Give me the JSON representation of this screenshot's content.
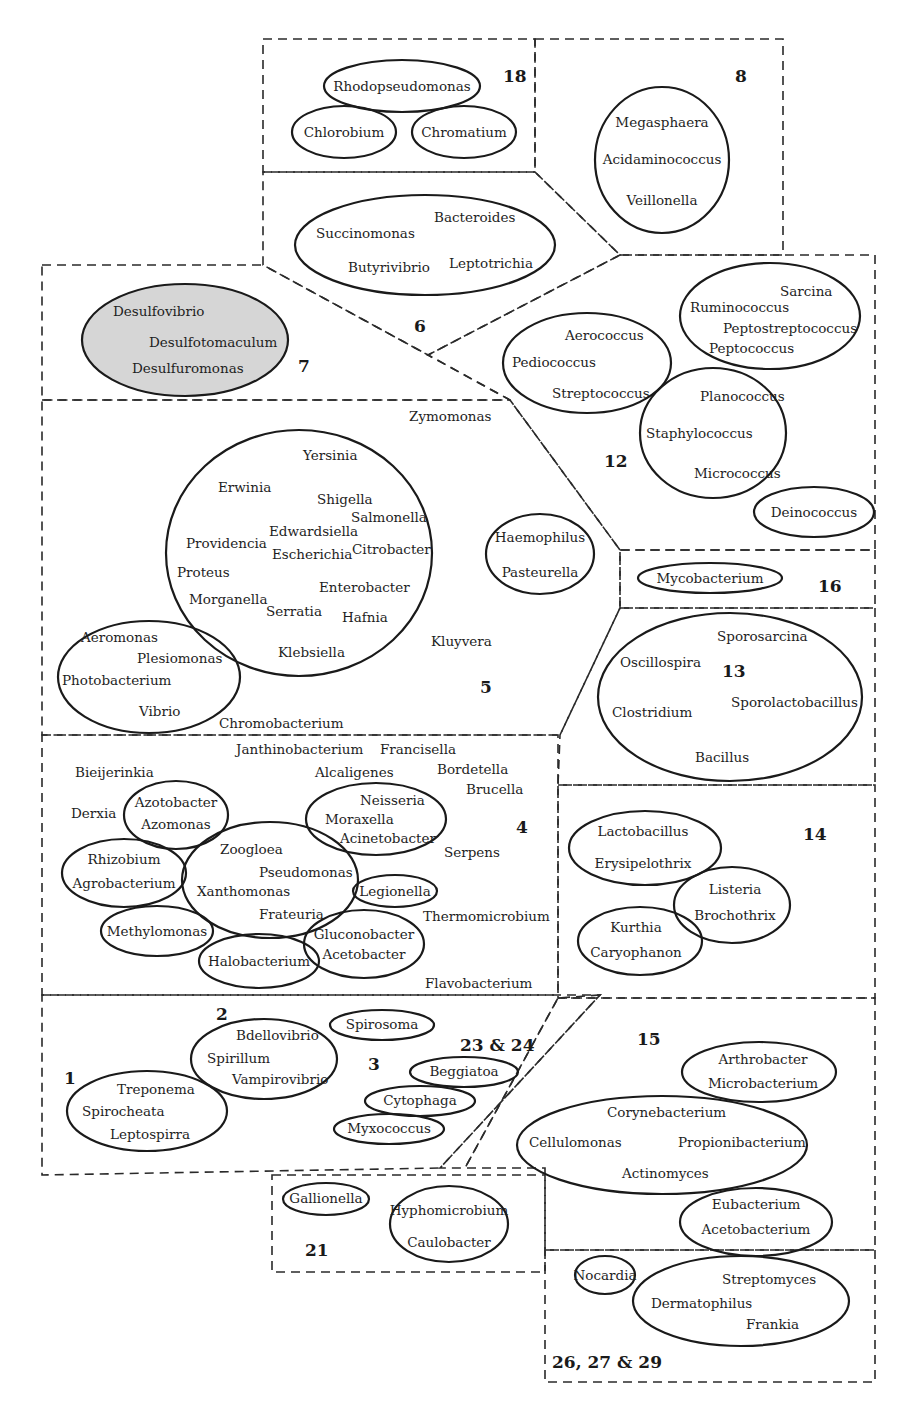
{
  "colors": {
    "line": "#1a1a1a",
    "shaded_fill": "#d6d6d6",
    "background": "#ffffff"
  },
  "boundaries": [
    {
      "name": "group-18-boundary",
      "points": "263,39 535,39 535,172 263,172"
    },
    {
      "name": "group-8-boundary",
      "points": "535,39 783,39 783,255 620,255 535,172"
    },
    {
      "name": "group-6-boundary",
      "points": "263,172 535,172 620,255 428,355 263,265"
    },
    {
      "name": "group-7-boundary",
      "points": "42,265 263,265 428,355 510,400 42,400"
    },
    {
      "name": "group-12-boundary",
      "points": "620,255 875,255 875,550 620,550 510,400 428,355"
    },
    {
      "name": "group-5-boundary",
      "points": "42,400 510,400 620,550 620,608 560,735 42,735"
    },
    {
      "name": "group-16-boundary",
      "points": "620,550 875,550 875,608 620,608"
    },
    {
      "name": "group-13-boundary",
      "points": "620,608 875,608 875,785 558,785 560,735"
    },
    {
      "name": "group-4-boundary",
      "points": "42,735 558,735 558,995 42,995"
    },
    {
      "name": "group-14-boundary",
      "points": "558,785 875,785 875,998 558,998"
    },
    {
      "name": "group-1-3-boundary",
      "points": "42,995 600,995 440,1168 42,1175"
    },
    {
      "name": "group-23-24-boundary",
      "points": "600,995 558,998 465,1168 440,1168"
    },
    {
      "name": "group-15-boundary",
      "points": "558,998 875,998 875,1250 545,1250 545,1168 465,1168"
    },
    {
      "name": "group-21-boundary",
      "points": "272,1175 545,1175 545,1272 272,1272"
    },
    {
      "name": "group-26-27-29-boundary",
      "points": "545,1250 875,1250 875,1382 545,1382"
    }
  ],
  "ellipses": [
    {
      "name": "ellipse-rhodopseudomonas",
      "cx": 402,
      "cy": 86,
      "rx": 78,
      "ry": 26
    },
    {
      "name": "ellipse-chlorobium",
      "cx": 344,
      "cy": 132,
      "rx": 52,
      "ry": 26
    },
    {
      "name": "ellipse-chromatium",
      "cx": 464,
      "cy": 132,
      "rx": 52,
      "ry": 26
    },
    {
      "name": "ellipse-group-8",
      "cx": 662,
      "cy": 160,
      "rx": 67,
      "ry": 73
    },
    {
      "name": "ellipse-group-6",
      "cx": 425,
      "cy": 245,
      "rx": 130,
      "ry": 50
    },
    {
      "name": "ellipse-group-7",
      "cx": 185,
      "cy": 340,
      "rx": 103,
      "ry": 56,
      "shaded": true
    },
    {
      "name": "ellipse-streptococcus",
      "cx": 587,
      "cy": 363,
      "rx": 84,
      "ry": 50
    },
    {
      "name": "ellipse-ruminococcus",
      "cx": 770,
      "cy": 316,
      "rx": 90,
      "ry": 53
    },
    {
      "name": "ellipse-staphylococcus",
      "cx": 713,
      "cy": 433,
      "rx": 73,
      "ry": 65
    },
    {
      "name": "ellipse-deinococcus",
      "cx": 814,
      "cy": 512,
      "rx": 60,
      "ry": 25
    },
    {
      "name": "ellipse-enterobacteria",
      "cx": 299,
      "cy": 553,
      "rx": 133,
      "ry": 123
    },
    {
      "name": "ellipse-haemophilus",
      "cx": 540,
      "cy": 554,
      "rx": 54,
      "ry": 40
    },
    {
      "name": "ellipse-vibrio",
      "cx": 149,
      "cy": 677,
      "rx": 91,
      "ry": 56
    },
    {
      "name": "ellipse-mycobacterium",
      "cx": 710,
      "cy": 578,
      "rx": 72,
      "ry": 15
    },
    {
      "name": "ellipse-group-13",
      "cx": 730,
      "cy": 697,
      "rx": 132,
      "ry": 84
    },
    {
      "name": "ellipse-azotobacter",
      "cx": 176,
      "cy": 815,
      "rx": 52,
      "ry": 34
    },
    {
      "name": "ellipse-rhizobium",
      "cx": 124,
      "cy": 873,
      "rx": 62,
      "ry": 34
    },
    {
      "name": "ellipse-pseudomonas",
      "cx": 270,
      "cy": 880,
      "rx": 88,
      "ry": 58
    },
    {
      "name": "ellipse-neisseria",
      "cx": 376,
      "cy": 819,
      "rx": 70,
      "ry": 36
    },
    {
      "name": "ellipse-legionella",
      "cx": 395,
      "cy": 891,
      "rx": 42,
      "ry": 16
    },
    {
      "name": "ellipse-methylomonas",
      "cx": 157,
      "cy": 931,
      "rx": 56,
      "ry": 25
    },
    {
      "name": "ellipse-halobacterium",
      "cx": 259,
      "cy": 961,
      "rx": 60,
      "ry": 27
    },
    {
      "name": "ellipse-gluconobacter",
      "cx": 364,
      "cy": 944,
      "rx": 60,
      "ry": 34
    },
    {
      "name": "ellipse-lactobacillus",
      "cx": 645,
      "cy": 848,
      "rx": 76,
      "ry": 37
    },
    {
      "name": "ellipse-listeria",
      "cx": 732,
      "cy": 905,
      "rx": 58,
      "ry": 38
    },
    {
      "name": "ellipse-kurthia",
      "cx": 640,
      "cy": 941,
      "rx": 62,
      "ry": 34
    },
    {
      "name": "ellipse-spirosoma",
      "cx": 382,
      "cy": 1025,
      "rx": 52,
      "ry": 15
    },
    {
      "name": "ellipse-spirillum",
      "cx": 264,
      "cy": 1059,
      "rx": 73,
      "ry": 40
    },
    {
      "name": "ellipse-treponema",
      "cx": 147,
      "cy": 1111,
      "rx": 80,
      "ry": 40
    },
    {
      "name": "ellipse-beggiatoa",
      "cx": 464,
      "cy": 1072,
      "rx": 54,
      "ry": 15
    },
    {
      "name": "ellipse-cytophaga",
      "cx": 420,
      "cy": 1101,
      "rx": 55,
      "ry": 15
    },
    {
      "name": "ellipse-myxococcus",
      "cx": 389,
      "cy": 1129,
      "rx": 55,
      "ry": 15
    },
    {
      "name": "ellipse-arthrobacter",
      "cx": 759,
      "cy": 1072,
      "rx": 77,
      "ry": 30
    },
    {
      "name": "ellipse-corynebacterium",
      "cx": 662,
      "cy": 1145,
      "rx": 145,
      "ry": 49
    },
    {
      "name": "ellipse-eubacterium",
      "cx": 756,
      "cy": 1222,
      "rx": 76,
      "ry": 34
    },
    {
      "name": "ellipse-gallionella",
      "cx": 326,
      "cy": 1199,
      "rx": 43,
      "ry": 16
    },
    {
      "name": "ellipse-hyphomicrobium",
      "cx": 449,
      "cy": 1224,
      "rx": 59,
      "ry": 38
    },
    {
      "name": "ellipse-nocardia",
      "cx": 605,
      "cy": 1275,
      "rx": 30,
      "ry": 19
    },
    {
      "name": "ellipse-streptomyces",
      "cx": 741,
      "cy": 1301,
      "rx": 108,
      "ry": 45
    }
  ],
  "group_labels": [
    {
      "text": "18",
      "x": 503,
      "y": 82
    },
    {
      "text": "8",
      "x": 735,
      "y": 82
    },
    {
      "text": "6",
      "x": 414,
      "y": 332
    },
    {
      "text": "7",
      "x": 298,
      "y": 372
    },
    {
      "text": "12",
      "x": 604,
      "y": 467
    },
    {
      "text": "5",
      "x": 480,
      "y": 693
    },
    {
      "text": "16",
      "x": 818,
      "y": 592
    },
    {
      "text": "13",
      "x": 722,
      "y": 677
    },
    {
      "text": "4",
      "x": 516,
      "y": 833
    },
    {
      "text": "14",
      "x": 803,
      "y": 840
    },
    {
      "text": "2",
      "x": 216,
      "y": 1020
    },
    {
      "text": "1",
      "x": 64,
      "y": 1084
    },
    {
      "text": "3",
      "x": 368,
      "y": 1070
    },
    {
      "text": "23 & 24",
      "x": 460,
      "y": 1051
    },
    {
      "text": "15",
      "x": 637,
      "y": 1045
    },
    {
      "text": "21",
      "x": 305,
      "y": 1256
    },
    {
      "text": "26, 27 & 29",
      "x": 552,
      "y": 1368
    }
  ],
  "genera": [
    {
      "text": "Rhodopseudomonas",
      "x": 402,
      "y": 91,
      "anchor": "middle"
    },
    {
      "text": "Chlorobium",
      "x": 344,
      "y": 137,
      "anchor": "middle"
    },
    {
      "text": "Chromatium",
      "x": 464,
      "y": 137,
      "anchor": "middle"
    },
    {
      "text": "Megasphaera",
      "x": 662,
      "y": 127,
      "anchor": "middle"
    },
    {
      "text": "Acidaminococcus",
      "x": 662,
      "y": 164,
      "anchor": "middle"
    },
    {
      "text": "Veillonella",
      "x": 662,
      "y": 205,
      "anchor": "middle"
    },
    {
      "text": "Succinomonas",
      "x": 316,
      "y": 238,
      "anchor": "start"
    },
    {
      "text": "Bacteroides",
      "x": 434,
      "y": 222,
      "anchor": "start"
    },
    {
      "text": "Butyrivibrio",
      "x": 348,
      "y": 272,
      "anchor": "start"
    },
    {
      "text": "Leptotrichia",
      "x": 449,
      "y": 268,
      "anchor": "start"
    },
    {
      "text": "Desulfovibrio",
      "x": 113,
      "y": 316,
      "anchor": "start"
    },
    {
      "text": "Desulfotomaculum",
      "x": 149,
      "y": 347,
      "anchor": "start"
    },
    {
      "text": "Desulfuromonas",
      "x": 132,
      "y": 373,
      "anchor": "start"
    },
    {
      "text": "Aerococcus",
      "x": 565,
      "y": 340,
      "anchor": "start"
    },
    {
      "text": "Pediococcus",
      "x": 512,
      "y": 367,
      "anchor": "start"
    },
    {
      "text": "Streptococcus",
      "x": 552,
      "y": 398,
      "anchor": "start"
    },
    {
      "text": "Sarcina",
      "x": 780,
      "y": 296,
      "anchor": "start"
    },
    {
      "text": "Ruminococcus",
      "x": 690,
      "y": 312,
      "anchor": "start"
    },
    {
      "text": "Peptostreptococcus",
      "x": 723,
      "y": 333,
      "anchor": "start"
    },
    {
      "text": "Peptococcus",
      "x": 709,
      "y": 353,
      "anchor": "start"
    },
    {
      "text": "Planococcus",
      "x": 700,
      "y": 401,
      "anchor": "start"
    },
    {
      "text": "Staphylococcus",
      "x": 646,
      "y": 438,
      "anchor": "start"
    },
    {
      "text": "Micrococcus",
      "x": 694,
      "y": 478,
      "anchor": "start"
    },
    {
      "text": "Deinococcus",
      "x": 814,
      "y": 517,
      "anchor": "middle"
    },
    {
      "text": "Zymomonas",
      "x": 409,
      "y": 421,
      "anchor": "start"
    },
    {
      "text": "Yersinia",
      "x": 303,
      "y": 460,
      "anchor": "start"
    },
    {
      "text": "Erwinia",
      "x": 218,
      "y": 492,
      "anchor": "start"
    },
    {
      "text": "Shigella",
      "x": 317,
      "y": 504,
      "anchor": "start"
    },
    {
      "text": "Salmonella",
      "x": 351,
      "y": 522,
      "anchor": "start"
    },
    {
      "text": "Edwardsiella",
      "x": 269,
      "y": 536,
      "anchor": "start"
    },
    {
      "text": "Providencia",
      "x": 186,
      "y": 548,
      "anchor": "start"
    },
    {
      "text": "Escherichia",
      "x": 272,
      "y": 559,
      "anchor": "start"
    },
    {
      "text": "Citrobacter",
      "x": 352,
      "y": 554,
      "anchor": "start"
    },
    {
      "text": "Proteus",
      "x": 177,
      "y": 577,
      "anchor": "start"
    },
    {
      "text": "Enterobacter",
      "x": 319,
      "y": 592,
      "anchor": "start"
    },
    {
      "text": "Morganella",
      "x": 189,
      "y": 604,
      "anchor": "start"
    },
    {
      "text": "Serratia",
      "x": 266,
      "y": 616,
      "anchor": "start"
    },
    {
      "text": "Hafnia",
      "x": 342,
      "y": 622,
      "anchor": "start"
    },
    {
      "text": "Klebsiella",
      "x": 278,
      "y": 657,
      "anchor": "start"
    },
    {
      "text": "Haemophilus",
      "x": 540,
      "y": 542,
      "anchor": "middle"
    },
    {
      "text": "Pasteurella",
      "x": 540,
      "y": 577,
      "anchor": "middle"
    },
    {
      "text": "Kluyvera",
      "x": 431,
      "y": 646,
      "anchor": "start"
    },
    {
      "text": "Aeromonas",
      "x": 81,
      "y": 642,
      "anchor": "start"
    },
    {
      "text": "Plesiomonas",
      "x": 137,
      "y": 663,
      "anchor": "start"
    },
    {
      "text": "Photobacterium",
      "x": 62,
      "y": 685,
      "anchor": "start"
    },
    {
      "text": "Vibrio",
      "x": 139,
      "y": 716,
      "anchor": "start"
    },
    {
      "text": "Chromobacterium",
      "x": 219,
      "y": 728,
      "anchor": "start"
    },
    {
      "text": "Mycobacterium",
      "x": 710,
      "y": 583,
      "anchor": "middle"
    },
    {
      "text": "Sporosarcina",
      "x": 717,
      "y": 641,
      "anchor": "start"
    },
    {
      "text": "Oscillospira",
      "x": 620,
      "y": 667,
      "anchor": "start"
    },
    {
      "text": "Sporolactobacillus",
      "x": 731,
      "y": 707,
      "anchor": "start"
    },
    {
      "text": "Clostridium",
      "x": 612,
      "y": 717,
      "anchor": "start"
    },
    {
      "text": "Bacillus",
      "x": 695,
      "y": 762,
      "anchor": "start"
    },
    {
      "text": "Janthinobacterium",
      "x": 236,
      "y": 754,
      "anchor": "start"
    },
    {
      "text": "Francisella",
      "x": 380,
      "y": 754,
      "anchor": "start"
    },
    {
      "text": "Bieijerinkia",
      "x": 75,
      "y": 777,
      "anchor": "start"
    },
    {
      "text": "Alcaligenes",
      "x": 315,
      "y": 777,
      "anchor": "start"
    },
    {
      "text": "Bordetella",
      "x": 437,
      "y": 774,
      "anchor": "start"
    },
    {
      "text": "Brucella",
      "x": 466,
      "y": 794,
      "anchor": "start"
    },
    {
      "text": "Derxia",
      "x": 71,
      "y": 818,
      "anchor": "start"
    },
    {
      "text": "Azotobacter",
      "x": 176,
      "y": 807,
      "anchor": "middle"
    },
    {
      "text": "Azomonas",
      "x": 176,
      "y": 829,
      "anchor": "middle"
    },
    {
      "text": "Neisseria",
      "x": 360,
      "y": 805,
      "anchor": "start"
    },
    {
      "text": "Moraxella",
      "x": 325,
      "y": 824,
      "anchor": "start"
    },
    {
      "text": "Acinetobacter",
      "x": 340,
      "y": 843,
      "anchor": "start"
    },
    {
      "text": "Serpens",
      "x": 444,
      "y": 857,
      "anchor": "start"
    },
    {
      "text": "Zoogloea",
      "x": 220,
      "y": 854,
      "anchor": "start"
    },
    {
      "text": "Rhizobium",
      "x": 124,
      "y": 864,
      "anchor": "middle"
    },
    {
      "text": "Pseudomonas",
      "x": 259,
      "y": 877,
      "anchor": "start"
    },
    {
      "text": "Agrobacterium",
      "x": 124,
      "y": 888,
      "anchor": "middle"
    },
    {
      "text": "Xanthomonas",
      "x": 197,
      "y": 896,
      "anchor": "start"
    },
    {
      "text": "Legionella",
      "x": 395,
      "y": 896,
      "anchor": "middle"
    },
    {
      "text": "Frateuria",
      "x": 259,
      "y": 919,
      "anchor": "start"
    },
    {
      "text": "Thermomicrobium",
      "x": 423,
      "y": 921,
      "anchor": "start"
    },
    {
      "text": "Methylomonas",
      "x": 157,
      "y": 936,
      "anchor": "middle"
    },
    {
      "text": "Gluconobacter",
      "x": 364,
      "y": 939,
      "anchor": "middle"
    },
    {
      "text": "Halobacterium",
      "x": 259,
      "y": 966,
      "anchor": "middle"
    },
    {
      "text": "Acetobacter",
      "x": 364,
      "y": 959,
      "anchor": "middle"
    },
    {
      "text": "Flavobacterium",
      "x": 425,
      "y": 988,
      "anchor": "start"
    },
    {
      "text": "Lactobacillus",
      "x": 643,
      "y": 836,
      "anchor": "middle"
    },
    {
      "text": "Erysipelothrix",
      "x": 643,
      "y": 868,
      "anchor": "middle"
    },
    {
      "text": "Listeria",
      "x": 735,
      "y": 894,
      "anchor": "middle"
    },
    {
      "text": "Brochothrix",
      "x": 735,
      "y": 920,
      "anchor": "middle"
    },
    {
      "text": "Kurthia",
      "x": 636,
      "y": 932,
      "anchor": "middle"
    },
    {
      "text": "Caryophanon",
      "x": 636,
      "y": 957,
      "anchor": "middle"
    },
    {
      "text": "Spirosoma",
      "x": 382,
      "y": 1029,
      "anchor": "middle"
    },
    {
      "text": "Bdellovibrio",
      "x": 236,
      "y": 1040,
      "anchor": "start"
    },
    {
      "text": "Spirillum",
      "x": 207,
      "y": 1063,
      "anchor": "start"
    },
    {
      "text": "Vampirovibrio",
      "x": 232,
      "y": 1084,
      "anchor": "start"
    },
    {
      "text": "Treponema",
      "x": 117,
      "y": 1094,
      "anchor": "start"
    },
    {
      "text": "Spirocheata",
      "x": 82,
      "y": 1116,
      "anchor": "start"
    },
    {
      "text": "Leptospirra",
      "x": 110,
      "y": 1139,
      "anchor": "start"
    },
    {
      "text": "Beggiatoa",
      "x": 464,
      "y": 1076,
      "anchor": "middle"
    },
    {
      "text": "Cytophaga",
      "x": 420,
      "y": 1105,
      "anchor": "middle"
    },
    {
      "text": "Myxococcus",
      "x": 389,
      "y": 1133,
      "anchor": "middle"
    },
    {
      "text": "Arthrobacter",
      "x": 763,
      "y": 1064,
      "anchor": "middle"
    },
    {
      "text": "Microbacterium",
      "x": 763,
      "y": 1088,
      "anchor": "middle"
    },
    {
      "text": "Corynebacterium",
      "x": 607,
      "y": 1117,
      "anchor": "start"
    },
    {
      "text": "Cellulomonas",
      "x": 529,
      "y": 1147,
      "anchor": "start"
    },
    {
      "text": "Propionibacterium",
      "x": 678,
      "y": 1147,
      "anchor": "start"
    },
    {
      "text": "Actinomyces",
      "x": 622,
      "y": 1178,
      "anchor": "start"
    },
    {
      "text": "Eubacterium",
      "x": 756,
      "y": 1209,
      "anchor": "middle"
    },
    {
      "text": "Acetobacterium",
      "x": 756,
      "y": 1234,
      "anchor": "middle"
    },
    {
      "text": "Gallionella",
      "x": 326,
      "y": 1203,
      "anchor": "middle"
    },
    {
      "text": "Hyphomicrobium",
      "x": 449,
      "y": 1215,
      "anchor": "middle"
    },
    {
      "text": "Caulobacter",
      "x": 449,
      "y": 1247,
      "anchor": "middle"
    },
    {
      "text": "Nocardia",
      "x": 605,
      "y": 1280,
      "anchor": "middle"
    },
    {
      "text": "Streptomyces",
      "x": 722,
      "y": 1284,
      "anchor": "start"
    },
    {
      "text": "Dermatophilus",
      "x": 651,
      "y": 1308,
      "anchor": "start"
    },
    {
      "text": "Frankia",
      "x": 746,
      "y": 1329,
      "anchor": "start"
    }
  ]
}
